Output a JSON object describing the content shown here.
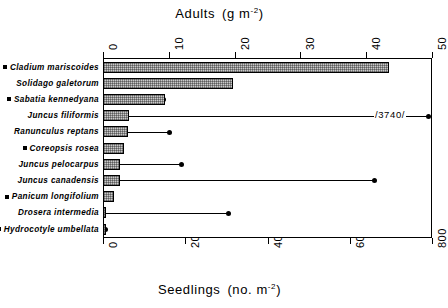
{
  "figure": {
    "top_axis_title_main": "Adults",
    "top_axis_title_unit_pre": "(g m",
    "top_axis_title_unit_sup": "-2",
    "top_axis_title_unit_post": ")",
    "bottom_axis_title_main": "Seedlings",
    "bottom_axis_title_unit_pre": "(no. m",
    "bottom_axis_title_unit_sup": "-2",
    "bottom_axis_title_unit_post": ")",
    "break_annotation": "/3740/"
  },
  "top_ticks": [
    "0",
    "10",
    "20",
    "30",
    "40",
    "50"
  ],
  "bottom_ticks": [
    "0",
    "200",
    "400",
    "600",
    "800"
  ],
  "species": [
    {
      "name": "Cladium mariscoides",
      "marker": true
    },
    {
      "name": "Solidago galetorum",
      "marker": false
    },
    {
      "name": "Sabatia kennedyana",
      "marker": true
    },
    {
      "name": "Juncus filiformis",
      "marker": false
    },
    {
      "name": "Ranunculus reptans",
      "marker": false
    },
    {
      "name": "Coreopsis rosea",
      "marker": true
    },
    {
      "name": "Juncus pelocarpus",
      "marker": false
    },
    {
      "name": "Juncus canadensis",
      "marker": false
    },
    {
      "name": "Panicum longifolium",
      "marker": true
    },
    {
      "name": "Drosera intermedia",
      "marker": false
    },
    {
      "name": "Hydrocotyle umbellata",
      "marker": true
    }
  ],
  "chart_data": {
    "type": "bar",
    "orientation": "horizontal",
    "categories": [
      "Cladium mariscoides",
      "Solidago galetorum",
      "Sabatia kennedyana",
      "Juncus filiformis",
      "Ranunculus reptans",
      "Coreopsis rosea",
      "Juncus pelocarpus",
      "Juncus canadensis",
      "Panicum longifolium",
      "Drosera intermedia",
      "Hydrocotyle umbellata"
    ],
    "series": [
      {
        "name": "Adults",
        "unit": "g m-2",
        "axis": "top",
        "render": "hatched-bar",
        "xlabel": "Adults (g m-2)",
        "xlim": [
          0,
          50
        ],
        "ticks": [
          0,
          10,
          20,
          30,
          40,
          50
        ],
        "values": [
          43.5,
          19.7,
          9.4,
          3.9,
          3.8,
          3.2,
          2.6,
          2.6,
          1.7,
          0.5,
          0.3
        ]
      },
      {
        "name": "Seedlings",
        "unit": "no. m-2",
        "axis": "bottom",
        "render": "dot-with-line",
        "xlabel": "Seedlings (no. m-2)",
        "xlim": [
          0,
          800
        ],
        "ticks": [
          0,
          200,
          400,
          600,
          800
        ],
        "values": [
          5,
          178,
          146,
          3740,
          161,
          17,
          190,
          660,
          17,
          305,
          4
        ],
        "off_scale": [
          {
            "category": "Juncus filiformis",
            "value": 3740,
            "label": "/3740/"
          }
        ]
      }
    ],
    "grid": false,
    "legend": "none"
  }
}
